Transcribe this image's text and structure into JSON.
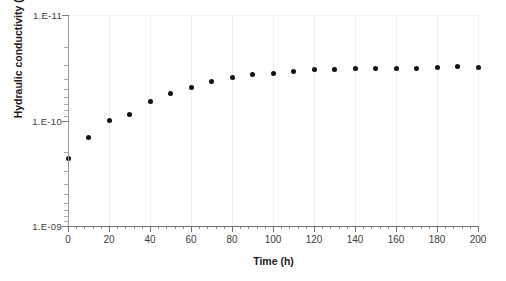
{
  "chart_data": {
    "type": "scatter",
    "title": "",
    "xlabel": "Time (h)",
    "ylabel": "Hydraulic conductivity (m/s)",
    "x": [
      0,
      10,
      20,
      30,
      40,
      50,
      60,
      70,
      80,
      90,
      100,
      110,
      120,
      130,
      140,
      150,
      160,
      170,
      180,
      190,
      200
    ],
    "values": [
      2.3e-10,
      1.45e-10,
      1e-10,
      8.7e-11,
      6.6e-11,
      5.6e-11,
      4.9e-11,
      4.3e-11,
      3.9e-11,
      3.7e-11,
      3.6e-11,
      3.4e-11,
      3.3e-11,
      3.25e-11,
      3.2e-11,
      3.2e-11,
      3.2e-11,
      3.2e-11,
      3.15e-11,
      3.1e-11,
      3.15e-11
    ],
    "xlim": [
      0,
      200
    ],
    "ylim": [
      1e-09,
      1e-11
    ],
    "yscale": "log",
    "y_inverted": true,
    "xtick_labels": [
      "0",
      "20",
      "40",
      "60",
      "80",
      "100",
      "120",
      "140",
      "160",
      "180",
      "200"
    ],
    "xtick_values": [
      0,
      20,
      40,
      60,
      80,
      100,
      120,
      140,
      160,
      180,
      200
    ],
    "xtick_minor_step": 4,
    "ytick_labels": [
      "1.E-11",
      "1.E-10",
      "1.E-09"
    ],
    "ytick_values": [
      1e-11,
      1e-10,
      1e-09
    ],
    "grid": "vertical-major-only",
    "legend": null,
    "marker_color": "#111111",
    "marker_shape": "circle"
  },
  "figure": {
    "background_color": "#ffffff",
    "axis_color": "#6f6f6f",
    "gridline_color": "#f0f0f0"
  }
}
